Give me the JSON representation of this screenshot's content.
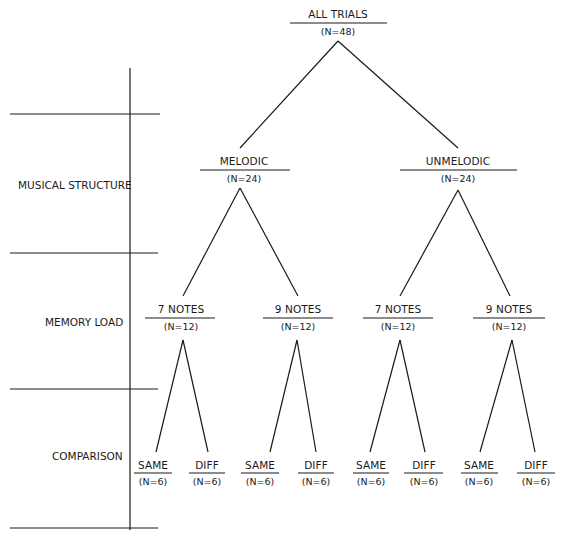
{
  "diagram": {
    "type": "tree",
    "row_labels": [
      {
        "id": "musical-structure",
        "label": "MUSICAL STRUCTURE"
      },
      {
        "id": "memory-load",
        "label": "MEMORY LOAD"
      },
      {
        "id": "comparison",
        "label": "COMPARISON"
      }
    ],
    "root": {
      "label": "ALL TRIALS",
      "n": "(N=48)"
    },
    "level1": [
      {
        "label": "MELODIC",
        "n": "(N=24)"
      },
      {
        "label": "UNMELODIC",
        "n": "(N=24)"
      }
    ],
    "level2": [
      {
        "label": "7 NOTES",
        "n": "(N=12)",
        "parent": "MELODIC"
      },
      {
        "label": "9 NOTES",
        "n": "(N=12)",
        "parent": "MELODIC"
      },
      {
        "label": "7 NOTES",
        "n": "(N=12)",
        "parent": "UNMELODIC"
      },
      {
        "label": "9 NOTES",
        "n": "(N=12)",
        "parent": "UNMELODIC"
      }
    ],
    "level3": [
      {
        "label": "SAME",
        "n": "(N=6)"
      },
      {
        "label": "DIFF",
        "n": "(N=6)"
      },
      {
        "label": "SAME",
        "n": "(N=6)"
      },
      {
        "label": "DIFF",
        "n": "(N=6)"
      },
      {
        "label": "SAME",
        "n": "(N=6)"
      },
      {
        "label": "DIFF",
        "n": "(N=6)"
      },
      {
        "label": "SAME",
        "n": "(N=6)"
      },
      {
        "label": "DIFF",
        "n": "(N=6)"
      }
    ]
  }
}
